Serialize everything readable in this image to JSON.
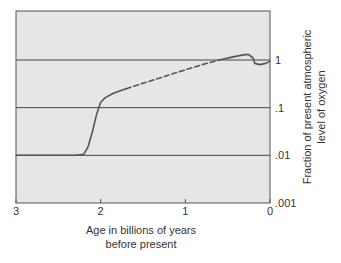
{
  "chart_data": {
    "type": "line",
    "title": "",
    "xlabel": [
      "Age in billions of years",
      "before present"
    ],
    "ylabel": [
      "Fraction of present atmospheric",
      "level of oxygen"
    ],
    "x_reversed": true,
    "xlim": [
      3,
      0
    ],
    "ylim": [
      0.001,
      1
    ],
    "y_scale": "log",
    "x_ticks": [
      3,
      2,
      1,
      0
    ],
    "x_tick_labels": [
      "3",
      "2",
      "1",
      "0"
    ],
    "y_ticks": [
      1,
      0.1,
      0.01,
      0.001
    ],
    "y_tick_labels": [
      "1",
      ".1",
      ".01",
      ".001"
    ],
    "grid": "horizontal",
    "series": [
      {
        "name": "oxygen level (solid)",
        "style": "solid",
        "points": [
          [
            3.0,
            0.01
          ],
          [
            2.3,
            0.01
          ],
          [
            2.2,
            0.0105
          ],
          [
            2.15,
            0.015
          ],
          [
            2.1,
            0.03
          ],
          [
            2.05,
            0.07
          ],
          [
            2.0,
            0.13
          ],
          [
            1.95,
            0.16
          ],
          [
            1.85,
            0.2
          ],
          [
            1.7,
            0.25
          ]
        ]
      },
      {
        "name": "oxygen level (uncertain)",
        "style": "dashed",
        "points": [
          [
            1.7,
            0.25
          ],
          [
            1.4,
            0.37
          ],
          [
            1.1,
            0.55
          ],
          [
            0.8,
            0.8
          ],
          [
            0.6,
            1.0
          ]
        ]
      },
      {
        "name": "oxygen level (recent)",
        "style": "solid",
        "points": [
          [
            0.6,
            1.0
          ],
          [
            0.45,
            1.15
          ],
          [
            0.3,
            1.3
          ],
          [
            0.25,
            1.3
          ],
          [
            0.2,
            1.1
          ],
          [
            0.18,
            0.85
          ],
          [
            0.12,
            0.8
          ],
          [
            0.05,
            0.85
          ],
          [
            0.0,
            0.95
          ]
        ]
      }
    ]
  },
  "colors": {
    "plot_background": "#e6e6e6",
    "line": "#555555",
    "grid": "#333333",
    "frame": "#555555"
  }
}
